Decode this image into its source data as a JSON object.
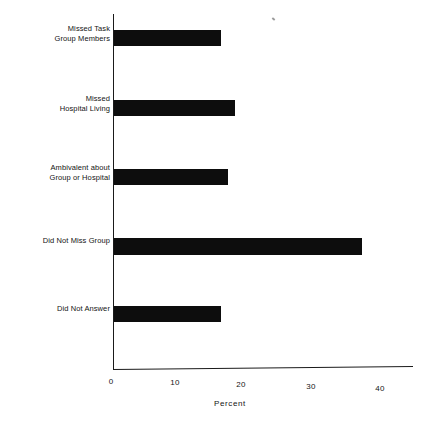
{
  "chart_data": {
    "type": "bar",
    "orientation": "horizontal",
    "title": "",
    "subtitle": "",
    "xlabel": "Percent",
    "ylabel": "",
    "categories": [
      "Missed Task\nGroup Members",
      "Missed\nHospital Living",
      "Ambivalent about\nGroup or Hospital",
      "Did Not Miss Group",
      "Did Not Answer"
    ],
    "values": [
      16,
      18,
      17,
      37,
      16
    ],
    "xticks": [
      0,
      10,
      20,
      30,
      40
    ],
    "xticklabels": [
      "0",
      "10",
      "20",
      "30",
      "40"
    ],
    "xlim": [
      0,
      45
    ],
    "grid": false,
    "legend": false,
    "bar_color": "#0d0d0d",
    "axis_color": "#1a1a1a",
    "background": "#ffffff"
  },
  "axis": {
    "x_title": "Percent"
  }
}
